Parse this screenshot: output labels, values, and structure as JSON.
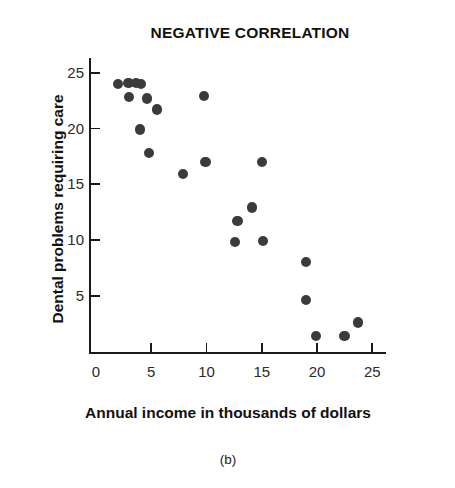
{
  "chart_data": {
    "type": "scatter",
    "title": "NEGATIVE CORRELATION",
    "xlabel": "Annual income in thousands of dollars",
    "ylabel": "Dental problems requiring care",
    "caption": "(b)",
    "xlim": [
      0,
      27
    ],
    "ylim": [
      0,
      26.5
    ],
    "xticks": [
      0,
      5,
      10,
      15,
      20,
      25
    ],
    "yticks": [
      5,
      10,
      15,
      20,
      25
    ],
    "xtick_labels": [
      "0",
      "5",
      "10",
      "15",
      "20",
      "25"
    ],
    "ytick_labels": [
      "5",
      "10",
      "15",
      "20",
      "25"
    ],
    "grid": false,
    "legend": null,
    "marker_color": "#3b3b3b",
    "axis_color": "#1a1a1a",
    "background_color": "#ffffff",
    "points": [
      {
        "x": 2.0,
        "y": 24.0
      },
      {
        "x": 2.95,
        "y": 24.1
      },
      {
        "x": 3.6,
        "y": 24.1
      },
      {
        "x": 4.1,
        "y": 24.0
      },
      {
        "x": 3.0,
        "y": 22.8
      },
      {
        "x": 4.6,
        "y": 22.7
      },
      {
        "x": 5.5,
        "y": 21.7
      },
      {
        "x": 4.0,
        "y": 19.9
      },
      {
        "x": 4.8,
        "y": 17.8
      },
      {
        "x": 7.9,
        "y": 15.9
      },
      {
        "x": 9.9,
        "y": 17.0
      },
      {
        "x": 9.8,
        "y": 22.9
      },
      {
        "x": 15.0,
        "y": 17.0
      },
      {
        "x": 14.1,
        "y": 12.9
      },
      {
        "x": 12.8,
        "y": 11.7
      },
      {
        "x": 12.6,
        "y": 9.8
      },
      {
        "x": 15.1,
        "y": 9.9
      },
      {
        "x": 19.0,
        "y": 8.0
      },
      {
        "x": 19.0,
        "y": 4.6
      },
      {
        "x": 19.9,
        "y": 1.4
      },
      {
        "x": 22.5,
        "y": 1.4
      },
      {
        "x": 23.7,
        "y": 2.6
      }
    ]
  }
}
